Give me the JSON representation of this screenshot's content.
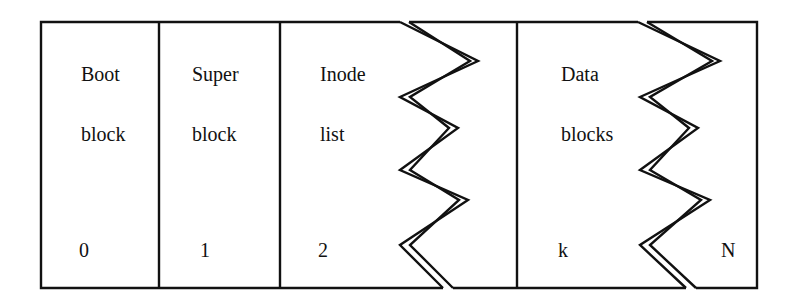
{
  "diagram": {
    "colors": {
      "stroke": "#111111",
      "background": "#ffffff",
      "text": "#111111"
    },
    "regions": [
      {
        "id": "boot",
        "line1": "Boot",
        "line2": "block",
        "index": "0"
      },
      {
        "id": "super",
        "line1": "Super",
        "line2": "block",
        "index": "1"
      },
      {
        "id": "inode",
        "line1": "Inode",
        "line2": "list",
        "index": "2"
      },
      {
        "id": "data",
        "line1": "Data",
        "line2": "blocks",
        "index": "k"
      }
    ],
    "end_index": "N",
    "break_markers": [
      "inode-list-break",
      "data-blocks-break"
    ]
  }
}
